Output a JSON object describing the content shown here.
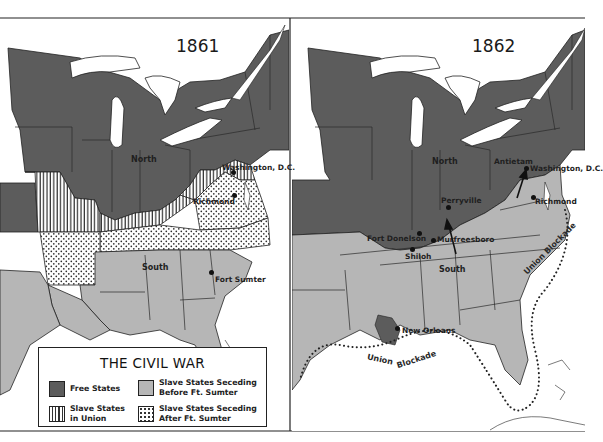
{
  "legend": {
    "title": "THE CIVIL WAR",
    "items": [
      {
        "key": "free",
        "label": "Free States",
        "color": "#5c5c5c"
      },
      {
        "key": "before",
        "label": "Slave States Seceding\nBefore Ft. Sumter",
        "color": "#b6b6b6"
      },
      {
        "key": "union",
        "label": "Slave States\nin Union",
        "pattern": "vertical-stripes"
      },
      {
        "key": "after",
        "label": "Slave States Seceding\nAfter Ft. Sumter",
        "pattern": "dots"
      }
    ]
  },
  "maps": [
    {
      "year": "1861",
      "labels": {
        "north": "North",
        "south": "South",
        "washington": "Washington, D.C.",
        "richmond": "Richmond",
        "fort_sumter": "Fort Sumter"
      }
    },
    {
      "year": "1862",
      "labels": {
        "north": "North",
        "south": "South",
        "antietam": "Antietam",
        "washington": "Washington, D.C.",
        "richmond": "Richmond",
        "perryville": "Perryville",
        "fort_donelson": "Fort Donelson",
        "murfreesboro": "Murfreesboro",
        "shiloh": "Shiloh",
        "new_orleans": "New Orleans",
        "blockade_atlantic": "Union Blockade",
        "blockade_gulf_1": "Union",
        "blockade_gulf_2": "Blockade"
      }
    }
  ],
  "colors": {
    "free": "#5c5c5c",
    "before": "#b6b6b6",
    "water": "#ffffff",
    "border": "#1e1e1e"
  }
}
